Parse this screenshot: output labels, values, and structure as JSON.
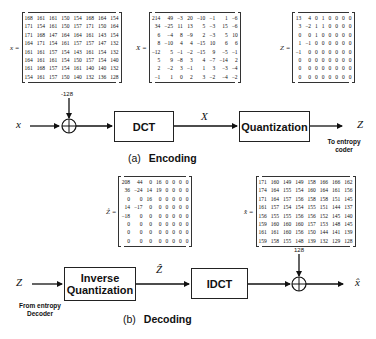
{
  "encoding": {
    "caption_prefix": "(a)",
    "caption": "Encoding",
    "input_symbol": "x",
    "offset_label": "-128",
    "dct_label": "DCT",
    "dct_output_symbol": "X",
    "quant_label": "Quantization",
    "output_symbol": "Z",
    "output_note": "To entropy coder",
    "matrices": {
      "x": {
        "label": "x =",
        "rows": [
          [
            168,
            161,
            161,
            150,
            154,
            168,
            164,
            154
          ],
          [
            171,
            154,
            161,
            150,
            157,
            171,
            150,
            164
          ],
          [
            171,
            168,
            147,
            164,
            164,
            161,
            143,
            154
          ],
          [
            164,
            171,
            154,
            161,
            157,
            157,
            147,
            132
          ],
          [
            161,
            161,
            157,
            154,
            143,
            161,
            154,
            132
          ],
          [
            164,
            161,
            161,
            154,
            150,
            157,
            154,
            140
          ],
          [
            161,
            168,
            157,
            154,
            161,
            140,
            140,
            132
          ],
          [
            154,
            161,
            157,
            150,
            140,
            132,
            136,
            128
          ]
        ]
      },
      "X": {
        "label": "X =",
        "rows": [
          [
            214,
            49,
            -3,
            20,
            -10,
            -1,
            1,
            -6
          ],
          [
            34,
            -25,
            11,
            13,
            5,
            -3,
            15,
            -6
          ],
          [
            6,
            -4,
            8,
            -9,
            2,
            -3,
            5,
            10
          ],
          [
            8,
            -10,
            4,
            4,
            -15,
            10,
            6,
            6
          ],
          [
            -12,
            5,
            -1,
            -2,
            -15,
            9,
            -5,
            -1
          ],
          [
            5,
            9,
            -8,
            3,
            4,
            -7,
            -14,
            2
          ],
          [
            2,
            -2,
            3,
            -1,
            1,
            3,
            -3,
            -4
          ],
          [
            -1,
            1,
            0,
            2,
            3,
            -2,
            -4,
            -2
          ]
        ]
      },
      "Z": {
        "label": "Z =",
        "rows": [
          [
            13,
            4,
            0,
            1,
            0,
            0,
            0,
            0
          ],
          [
            3,
            -2,
            1,
            1,
            0,
            0,
            0,
            0
          ],
          [
            0,
            0,
            1,
            0,
            0,
            0,
            0,
            0
          ],
          [
            1,
            -1,
            0,
            0,
            0,
            0,
            0,
            0
          ],
          [
            -1,
            0,
            0,
            0,
            0,
            0,
            0,
            0
          ],
          [
            0,
            0,
            0,
            0,
            0,
            0,
            0,
            0
          ],
          [
            0,
            0,
            0,
            0,
            0,
            0,
            0,
            0
          ],
          [
            0,
            0,
            0,
            0,
            0,
            0,
            0,
            0
          ]
        ]
      }
    }
  },
  "decoding": {
    "caption_prefix": "(b)",
    "caption": "Decoding",
    "input_symbol": "Z",
    "input_note": "From entropy Decoder",
    "iq_label": "Inverse Quantization",
    "iq_output_symbol": "Ẑ",
    "idct_label": "IDCT",
    "offset_label": "128",
    "output_symbol": "x̂",
    "matrices": {
      "Zhat": {
        "label": "Ẑ =",
        "rows": [
          [
            208,
            44,
            0,
            16,
            0,
            0,
            0,
            0
          ],
          [
            36,
            -24,
            14,
            19,
            0,
            0,
            0,
            0
          ],
          [
            0,
            0,
            16,
            0,
            0,
            0,
            0,
            0
          ],
          [
            14,
            -17,
            0,
            0,
            0,
            0,
            0,
            0
          ],
          [
            -18,
            0,
            0,
            0,
            0,
            0,
            0,
            0
          ],
          [
            0,
            0,
            0,
            0,
            0,
            0,
            0,
            0
          ],
          [
            0,
            0,
            0,
            0,
            0,
            0,
            0,
            0
          ],
          [
            0,
            0,
            0,
            0,
            0,
            0,
            0,
            0
          ]
        ]
      },
      "xhat": {
        "label": "x̂ =",
        "rows": [
          [
            171,
            160,
            149,
            149,
            158,
            166,
            166,
            162
          ],
          [
            174,
            164,
            155,
            154,
            160,
            164,
            161,
            156
          ],
          [
            171,
            164,
            157,
            156,
            158,
            158,
            151,
            145
          ],
          [
            161,
            157,
            154,
            154,
            155,
            151,
            144,
            137
          ],
          [
            156,
            155,
            155,
            156,
            156,
            152,
            145,
            140
          ],
          [
            159,
            160,
            160,
            160,
            157,
            153,
            148,
            145
          ],
          [
            161,
            161,
            160,
            156,
            150,
            144,
            141,
            139
          ],
          [
            159,
            158,
            155,
            148,
            139,
            132,
            129,
            128
          ]
        ]
      }
    }
  }
}
